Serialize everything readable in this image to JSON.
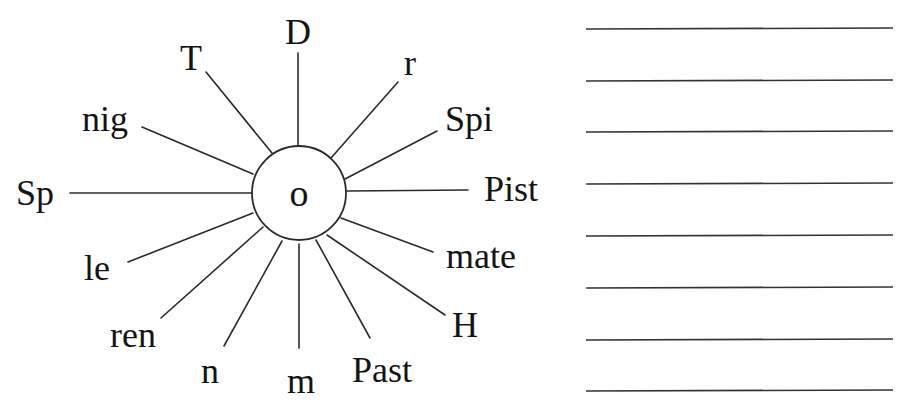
{
  "worksheet": {
    "type": "word-wheel",
    "hub": {
      "letter": "o",
      "cx": 299,
      "cy": 193,
      "r": 47
    },
    "spokes": [
      {
        "id": "D",
        "label": "D",
        "x1": 298,
        "y1": 146,
        "x2": 298,
        "y2": 53,
        "tx": 298,
        "ty": 44,
        "anchor": "middle"
      },
      {
        "id": "r",
        "label": "r",
        "x1": 331,
        "y1": 158,
        "x2": 398,
        "y2": 82,
        "tx": 410,
        "ty": 75,
        "anchor": "middle"
      },
      {
        "id": "Spi",
        "label": "Spi",
        "x1": 345,
        "y1": 179,
        "x2": 437,
        "y2": 131,
        "tx": 445,
        "ty": 131,
        "anchor": "start"
      },
      {
        "id": "Pist",
        "label": "Pist",
        "x1": 347,
        "y1": 191,
        "x2": 468,
        "y2": 190,
        "tx": 484,
        "ty": 201,
        "anchor": "start"
      },
      {
        "id": "mate",
        "label": "mate",
        "x1": 341,
        "y1": 218,
        "x2": 433,
        "y2": 252,
        "tx": 446,
        "ty": 268,
        "anchor": "start"
      },
      {
        "id": "H",
        "label": "H",
        "x1": 327,
        "y1": 235,
        "x2": 445,
        "y2": 315,
        "tx": 452,
        "ty": 337,
        "anchor": "start"
      },
      {
        "id": "Past",
        "label": "Past",
        "x1": 316,
        "y1": 240,
        "x2": 370,
        "y2": 338,
        "tx": 352,
        "ty": 382,
        "anchor": "start"
      },
      {
        "id": "m",
        "label": "m",
        "x1": 299,
        "y1": 244,
        "x2": 299,
        "y2": 348,
        "tx": 301,
        "ty": 393,
        "anchor": "middle"
      },
      {
        "id": "n",
        "label": "n",
        "x1": 282,
        "y1": 241,
        "x2": 224,
        "y2": 346,
        "tx": 210,
        "ty": 383,
        "anchor": "middle"
      },
      {
        "id": "ren",
        "label": "ren",
        "x1": 263,
        "y1": 227,
        "x2": 161,
        "y2": 318,
        "tx": 110,
        "ty": 347,
        "anchor": "start"
      },
      {
        "id": "le",
        "label": "le",
        "x1": 253,
        "y1": 213,
        "x2": 128,
        "y2": 262,
        "tx": 84,
        "ty": 280,
        "anchor": "start"
      },
      {
        "id": "Sp",
        "label": "Sp",
        "x1": 253,
        "y1": 193,
        "x2": 70,
        "y2": 193,
        "tx": 16,
        "ty": 205,
        "anchor": "start"
      },
      {
        "id": "nig",
        "label": "nig",
        "x1": 253,
        "y1": 174,
        "x2": 142,
        "y2": 127,
        "tx": 82,
        "ty": 131,
        "anchor": "start"
      },
      {
        "id": "T",
        "label": "T",
        "x1": 272,
        "y1": 153,
        "x2": 206,
        "y2": 72,
        "tx": 191,
        "ty": 70,
        "anchor": "middle"
      }
    ],
    "answer_lines": {
      "count": 8,
      "x1": 586,
      "x2": 893,
      "ys": [
        29,
        81,
        132,
        184,
        236,
        288,
        340,
        391
      ]
    }
  }
}
